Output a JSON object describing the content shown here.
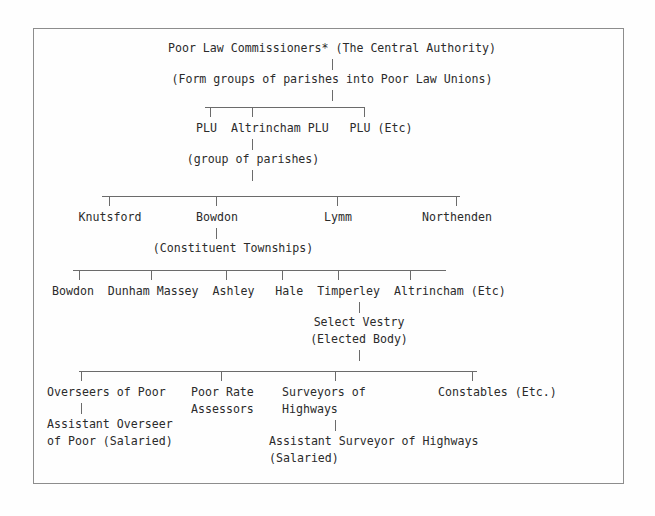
{
  "diagram": {
    "title_row": "Poor Law Commissioners* (The Central Authority)",
    "central_authority_note": "(Form groups of parishes into Poor Law Unions)",
    "plu_row": "PLU  Altrincham PLU   PLU (Etc)",
    "plu_label_1": "PLU",
    "plu_label_2": "Altrincham PLU",
    "plu_label_3": "PLU (Etc)",
    "group_of_parishes": "(group of parishes)",
    "parish_1": "Knutsford",
    "parish_2": "Bowdon",
    "parish_3": "Lymm",
    "parish_4": "Northenden",
    "constituent_townships": "(Constituent Townships)",
    "township_row": "Bowdon  Dunham Massey  Ashley   Hale  Timperley  Altrincham (Etc)",
    "township_1": "Bowdon",
    "township_2": "Dunham Massey",
    "township_3": "Ashley",
    "township_4": "Hale",
    "township_5": "Timperley",
    "township_6": "Altrincham (Etc)",
    "select_vestry": "Select Vestry",
    "elected_body": "(Elected Body)",
    "officer_1_line1": "Overseers of Poor",
    "officer_2_line1": "Poor Rate",
    "officer_2_line2": "Assessors",
    "officer_3_line1": "Surveyors of",
    "officer_3_line2": "Highways",
    "officer_4_line1": "Constables (Etc.)",
    "assistant_overseer_line1": "Assistant Overseer",
    "assistant_overseer_line2": "of Poor (Salaried)",
    "assistant_surveyor_line1": "Assistant Surveyor of Highways",
    "assistant_surveyor_line2": "(Salaried)"
  },
  "style": {
    "text_color": "#2b2b2b",
    "rule_color": "#6b6b6b",
    "frame_color": "#8d8d8d",
    "background": "#fefefe"
  }
}
